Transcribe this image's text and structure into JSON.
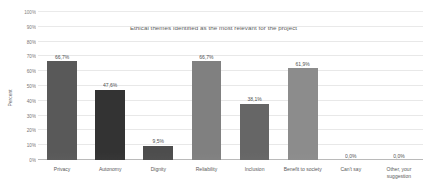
{
  "chart_data": {
    "type": "bar",
    "title": "Ethical themes identified as the most relevant for the project",
    "xlabel": "",
    "ylabel": "Percent",
    "ylim": [
      0,
      100
    ],
    "grid": true,
    "legend": "none",
    "categories": [
      "Privacy",
      "Autonomy",
      "Dignity",
      "Reliability",
      "Inclusion",
      "Benefit to society",
      "Can't say",
      "Other, your suggestion"
    ],
    "category_lines": [
      [
        "Privacy"
      ],
      [
        "Autonomy"
      ],
      [
        "Dignity"
      ],
      [
        "Reliability"
      ],
      [
        "Inclusion"
      ],
      [
        "Benefit to society"
      ],
      [
        "Can't say"
      ],
      [
        "Other, your",
        "suggestion"
      ]
    ],
    "values": [
      66.7,
      47.6,
      9.5,
      66.7,
      38.1,
      61.9,
      0.0,
      0.0
    ],
    "value_labels": [
      "66,7%",
      "47,6%",
      "9,5%",
      "66,7%",
      "38,1%",
      "61,9%",
      "0,0%",
      "0,0%"
    ],
    "bar_colors": [
      "#595959",
      "#333333",
      "#4d4d4d",
      "#808080",
      "#666666",
      "#8c8c8c",
      "#8c8c8c",
      "#8c8c8c"
    ],
    "y_ticks": [
      0,
      10,
      20,
      30,
      40,
      50,
      60,
      70,
      80,
      90,
      100
    ],
    "y_tick_labels": [
      "0%",
      "10%",
      "20%",
      "30%",
      "40%",
      "50%",
      "60%",
      "70%",
      "80%",
      "90%",
      "100%"
    ],
    "grid_color": "#e4e4e4",
    "axis_color": "#b9b9b9",
    "background": "#ffffff"
  }
}
